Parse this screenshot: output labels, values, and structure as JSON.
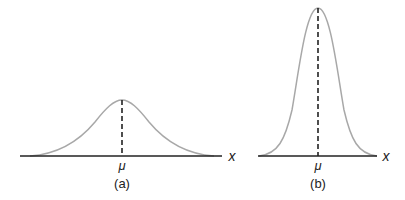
{
  "figure": {
    "panels": [
      {
        "id": "a",
        "caption": "(a)",
        "mean_label": "μ",
        "axis_label": "x",
        "description": "Wide, short normal distribution curve with dashed line at the mean"
      },
      {
        "id": "b",
        "caption": "(b)",
        "mean_label": "μ",
        "axis_label": "x",
        "description": "Narrow, tall normal distribution curve with dashed line at the mean"
      }
    ]
  },
  "colors": {
    "curve": "#a8a8a8",
    "axis": "#222222",
    "dash": "#222222"
  }
}
